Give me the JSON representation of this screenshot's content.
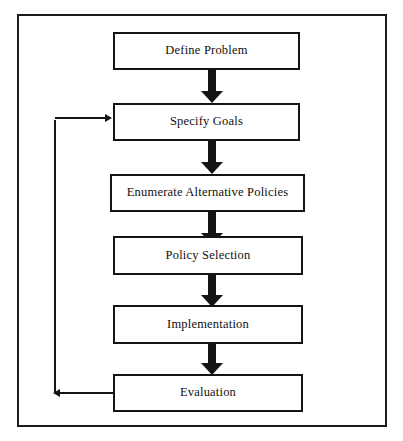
{
  "diagram": {
    "type": "flowchart",
    "orientation": "vertical",
    "title": "",
    "frame": {
      "border_color": "#1a1a1a"
    },
    "style": {
      "node_fill": "#ffffff",
      "node_border": "#141414",
      "arrow_color": "#141414",
      "text_color": "#101010"
    },
    "nodes": [
      {
        "id": "define-problem",
        "label": "Define Problem",
        "order": 1
      },
      {
        "id": "specify-goals",
        "label": "Specify Goals",
        "order": 2
      },
      {
        "id": "enumerate-alternative-policies",
        "label": "Enumerate Alternative Policies",
        "order": 3
      },
      {
        "id": "policy-selection",
        "label": "Policy Selection",
        "order": 4
      },
      {
        "id": "implementation",
        "label": "Implementation",
        "order": 5
      },
      {
        "id": "evaluation",
        "label": "Evaluation",
        "order": 6
      }
    ],
    "edges": [
      {
        "from": "define-problem",
        "to": "specify-goals",
        "style": "block-arrow",
        "direction": "down"
      },
      {
        "from": "specify-goals",
        "to": "enumerate-alternative-policies",
        "style": "block-arrow",
        "direction": "down"
      },
      {
        "from": "enumerate-alternative-policies",
        "to": "policy-selection",
        "style": "block-arrow",
        "direction": "down"
      },
      {
        "from": "policy-selection",
        "to": "implementation",
        "style": "block-arrow",
        "direction": "down"
      },
      {
        "from": "implementation",
        "to": "evaluation",
        "style": "block-arrow",
        "direction": "down"
      },
      {
        "from": "evaluation",
        "to": "specify-goals",
        "style": "feedback-line",
        "direction": "left-up-right"
      }
    ]
  }
}
